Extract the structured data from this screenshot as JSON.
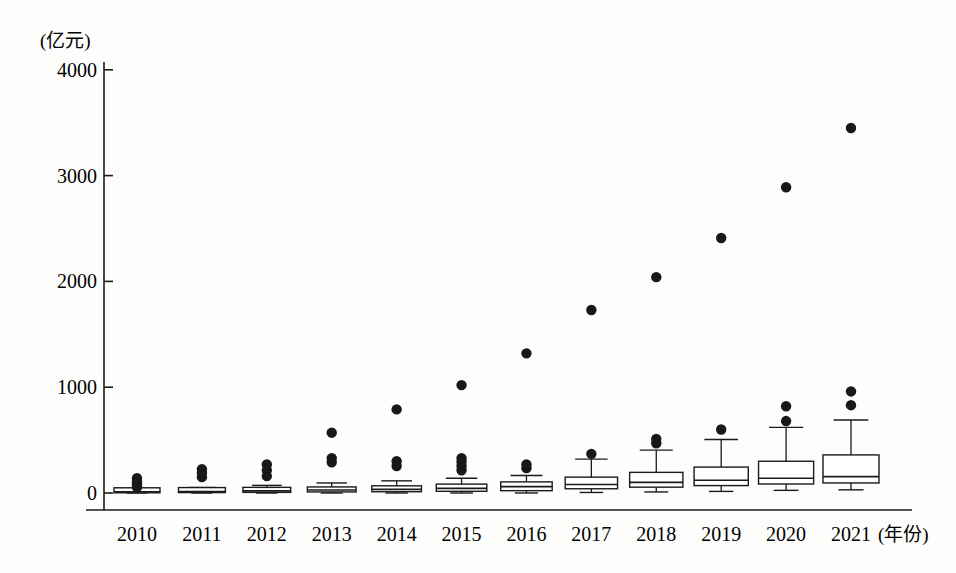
{
  "chart_data": {
    "type": "boxplot",
    "title": "",
    "subtitle": "",
    "xlabel": "(年份)",
    "ylabel": "(亿元)",
    "ylim": [
      0,
      4200
    ],
    "yticks": [
      0,
      1000,
      2000,
      3000,
      4000
    ],
    "ytick_labels": [
      "0",
      "1000",
      "2000",
      "3000",
      "4000"
    ],
    "grid": false,
    "legend": null,
    "categories": [
      "2010",
      "2011",
      "2012",
      "2013",
      "2014",
      "2015",
      "2016",
      "2017",
      "2018",
      "2019",
      "2020",
      "2021"
    ],
    "boxes": [
      {
        "category": "2010",
        "whisker_low": 0,
        "q1": 2,
        "median": 8,
        "q3": 18,
        "whisker_high": 30,
        "outliers": [
          55,
          70,
          90,
          105,
          140
        ]
      },
      {
        "category": "2011",
        "whisker_low": 0,
        "q1": 4,
        "median": 14,
        "q3": 28,
        "whisker_high": 52,
        "outliers": [
          150,
          190,
          225
        ]
      },
      {
        "category": "2012",
        "whisker_low": 0,
        "q1": 6,
        "median": 20,
        "q3": 40,
        "whisker_high": 72,
        "outliers": [
          160,
          215,
          270
        ]
      },
      {
        "category": "2013",
        "whisker_low": 0,
        "q1": 10,
        "median": 28,
        "q3": 55,
        "whisker_high": 95,
        "outliers": [
          290,
          330,
          570
        ]
      },
      {
        "category": "2014",
        "whisker_low": 0,
        "q1": 12,
        "median": 34,
        "q3": 68,
        "whisker_high": 115,
        "outliers": [
          255,
          300,
          790
        ]
      },
      {
        "category": "2015",
        "whisker_low": 0,
        "q1": 16,
        "median": 44,
        "q3": 84,
        "whisker_high": 140,
        "outliers": [
          215,
          255,
          295,
          330,
          1020
        ]
      },
      {
        "category": "2016",
        "whisker_low": 0,
        "q1": 22,
        "median": 60,
        "q3": 105,
        "whisker_high": 165,
        "outliers": [
          235,
          270,
          1320
        ]
      },
      {
        "category": "2017",
        "whisker_low": 5,
        "q1": 40,
        "median": 80,
        "q3": 150,
        "whisker_high": 320,
        "outliers": [
          370,
          1730
        ]
      },
      {
        "category": "2018",
        "whisker_low": 10,
        "q1": 55,
        "median": 100,
        "q3": 195,
        "whisker_high": 405,
        "outliers": [
          470,
          510,
          2040
        ]
      },
      {
        "category": "2019",
        "whisker_low": 15,
        "q1": 70,
        "median": 120,
        "q3": 245,
        "whisker_high": 505,
        "outliers": [
          600,
          2410
        ]
      },
      {
        "category": "2020",
        "whisker_low": 25,
        "q1": 85,
        "median": 140,
        "q3": 300,
        "whisker_high": 620,
        "outliers": [
          680,
          820,
          2890
        ]
      },
      {
        "category": "2021",
        "whisker_low": 30,
        "q1": 95,
        "median": 155,
        "q3": 360,
        "whisker_high": 690,
        "outliers": [
          830,
          960,
          3450
        ]
      }
    ]
  },
  "axes": {
    "y_unit": "(亿元)",
    "x_unit": "(年份)"
  }
}
